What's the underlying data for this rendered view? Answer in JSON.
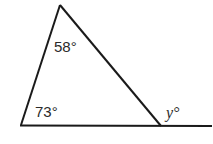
{
  "diagram": {
    "type": "triangle-exterior-angle",
    "stroke_color": "#1a1a1a",
    "vertices": {
      "top": [
        60,
        5
      ],
      "bottom_left": [
        21,
        125
      ],
      "bottom_right": [
        161,
        126
      ]
    },
    "baseline_extension_end": [
      212,
      126
    ],
    "labels": {
      "top_angle": "58°",
      "bottom_left_angle": "73°",
      "exterior_angle": "y°"
    }
  }
}
